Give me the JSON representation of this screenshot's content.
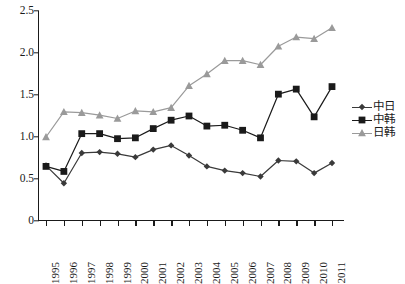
{
  "chart_data": {
    "type": "line",
    "title": "",
    "subtitle": "",
    "xlabel": "",
    "ylabel": "",
    "categories": [
      "1995",
      "1996",
      "1997",
      "1998",
      "1999",
      "2000",
      "2001",
      "2002",
      "2003",
      "2004",
      "2005",
      "2006",
      "2007",
      "2008",
      "2009",
      "2010",
      "2011"
    ],
    "x": [
      1995,
      1996,
      1997,
      1998,
      1999,
      2000,
      2001,
      2002,
      2003,
      2004,
      2005,
      2006,
      2007,
      2008,
      2009,
      2010,
      2011
    ],
    "ylim": [
      0,
      2.5
    ],
    "yticks": [
      "0",
      "0.5",
      "1.0",
      "1.5",
      "2.0",
      "2.5"
    ],
    "ytick_values": [
      0,
      0.5,
      1.0,
      1.5,
      2.0,
      2.5
    ],
    "grid": false,
    "legend_position": "right",
    "series": [
      {
        "name": "中日",
        "color": "#3a3a3a",
        "marker": "diamond",
        "values": [
          0.66,
          0.45,
          0.81,
          0.82,
          0.8,
          0.76,
          0.85,
          0.9,
          0.78,
          0.65,
          0.6,
          0.57,
          0.53,
          0.72,
          0.71,
          0.57,
          0.69
        ]
      },
      {
        "name": "中韩",
        "color": "#1a1a1a",
        "marker": "square",
        "values": [
          0.65,
          0.59,
          1.04,
          1.04,
          0.98,
          0.99,
          1.1,
          1.2,
          1.25,
          1.13,
          1.14,
          1.08,
          0.99,
          1.51,
          1.57,
          1.24,
          1.6
        ]
      },
      {
        "name": "日韩",
        "color": "#9a9a9a",
        "marker": "triangle",
        "values": [
          1.0,
          1.3,
          1.29,
          1.26,
          1.22,
          1.31,
          1.3,
          1.35,
          1.61,
          1.75,
          1.91,
          1.91,
          1.86,
          2.08,
          2.19,
          2.17,
          2.3
        ]
      }
    ]
  },
  "legend": {
    "items": [
      {
        "label": "中日"
      },
      {
        "label": "中韩"
      },
      {
        "label": "日韩"
      }
    ]
  },
  "colors": {
    "axis": "#1a1a1a",
    "series_zhongri": "#3a3a3a",
    "series_zhonghan": "#1a1a1a",
    "series_rihan": "#9a9a9a",
    "background": "#ffffff"
  }
}
